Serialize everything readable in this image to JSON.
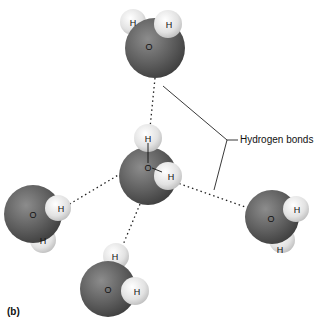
{
  "figure": {
    "panel_label": "(b)",
    "annotation": "Hydrogen bonds",
    "atom_labels": {
      "oxygen": "O",
      "hydrogen": "H"
    },
    "colors": {
      "oxygen": "#5a5a5a",
      "hydrogen": "#e0e0e0",
      "bond_line": "#222222",
      "background": "#ffffff"
    },
    "molecules": [
      {
        "name": "top-water",
        "O": [
          155,
          48
        ],
        "H": [
          [
            133,
            22
          ],
          [
            168,
            24
          ]
        ]
      },
      {
        "name": "center-water",
        "O": [
          148,
          176
        ],
        "H": [
          [
            148,
            138
          ],
          [
            168,
            176
          ]
        ]
      },
      {
        "name": "left-water",
        "O": [
          33,
          214
        ],
        "H": [
          [
            58,
            208
          ],
          [
            43,
            240
          ]
        ]
      },
      {
        "name": "right-water",
        "O": [
          272,
          217
        ],
        "H": [
          [
            296,
            209
          ],
          [
            282,
            240
          ]
        ]
      },
      {
        "name": "bottom-water",
        "O": [
          108,
          289
        ],
        "H": [
          [
            116,
            256
          ],
          [
            135,
            291
          ]
        ]
      }
    ]
  }
}
